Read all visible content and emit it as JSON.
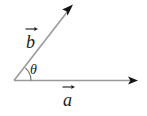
{
  "figure": {
    "type": "vector-angle-diagram",
    "background_color": "#ffffff",
    "labels": {
      "vector_b": "b",
      "vector_a": "a",
      "angle": "θ"
    },
    "icons": {
      "vector_arrow_overbar": "right-arrow-overbar",
      "arrowhead": "arrowhead"
    },
    "geometry": {
      "origin": {
        "x": 14,
        "y": 81
      },
      "vector_a": {
        "name": "a",
        "tip": {
          "x": 138,
          "y": 80
        },
        "angle_degrees": 0,
        "length_px": 124,
        "color": "#8c8c8c"
      },
      "vector_b": {
        "name": "b",
        "tip": {
          "x": 73,
          "y": 5
        },
        "angle_degrees": 49,
        "length_px": 96,
        "color": "#8c8c8c"
      },
      "angle_arc": {
        "label": "θ",
        "radius_px": 17,
        "start_degrees": 0,
        "end_degrees": 49,
        "color": "#6b6b6b"
      }
    },
    "colors": {
      "line": "#8c8c8c",
      "arrowhead": "#1a1a1a",
      "text": "#1a1a1a",
      "arc": "#6b6b6b"
    }
  }
}
